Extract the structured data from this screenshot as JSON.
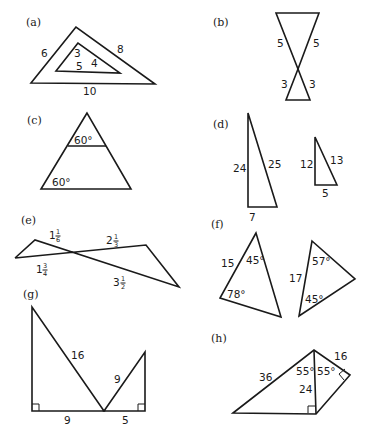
{
  "figure": {
    "panels": [
      {
        "tag": "(a)",
        "labels": {
          "outer_left": "6",
          "outer_right": "8",
          "outer_bottom": "10",
          "inner_left": "3",
          "inner_right": "4",
          "inner_bottom": "5"
        }
      },
      {
        "tag": "(b)",
        "labels": {
          "top_left": "5",
          "top_right": "5",
          "bottom_left": "3",
          "bottom_right": "3"
        }
      },
      {
        "tag": "(c)",
        "labels": {
          "upper_angle": "60°",
          "lower_angle": "60°"
        }
      },
      {
        "tag": "(d)",
        "labels": {
          "large_leg": "24",
          "large_hyp": "25",
          "large_base": "7",
          "small_leg": "12",
          "small_hyp": "13",
          "small_base": "5"
        }
      },
      {
        "tag": "(e)",
        "labels": {
          "left_top": {
            "whole": "1",
            "num": "1",
            "den": "6"
          },
          "left_bottom": {
            "whole": "1",
            "num": "3",
            "den": "4"
          },
          "right_top": {
            "whole": "2",
            "num": "1",
            "den": "3"
          },
          "right_bottom": {
            "whole": "3",
            "num": "1",
            "den": "2"
          }
        }
      },
      {
        "tag": "(f)",
        "labels": {
          "left_side": "15",
          "left_top_angle": "45°",
          "left_bottom_angle": "78°",
          "right_side": "17",
          "right_top_angle": "57°",
          "right_bottom_angle": "45°"
        }
      },
      {
        "tag": "(g)",
        "labels": {
          "left_hyp": "16",
          "right_hyp": "9",
          "left_base": "9",
          "right_base": "5"
        }
      },
      {
        "tag": "(h)",
        "labels": {
          "left_side": "36",
          "right_side": "16",
          "shared_side": "24",
          "left_angle": "55°",
          "right_angle": "55°"
        }
      }
    ]
  }
}
